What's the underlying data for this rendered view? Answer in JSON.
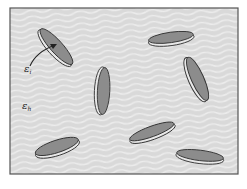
{
  "diagram": {
    "colors": {
      "host_fill": "#d9d9d9",
      "host_wave": "#ececec",
      "frame": "#555555",
      "disc_face": "#8c8c8c",
      "disc_rim": "#e8e8e8",
      "disc_outline": "#333333",
      "arrow": "#222222"
    },
    "labels": {
      "inclusion": {
        "symbol": "ε",
        "subscript": "i"
      },
      "host": {
        "symbol": "ε",
        "subscript": "h"
      }
    },
    "inclusions": [
      {
        "cx": 56,
        "cy": 47,
        "rx": 24,
        "ry": 7,
        "angle": 48
      },
      {
        "cx": 103,
        "cy": 91,
        "rx": 24,
        "ry": 7,
        "angle": 93
      },
      {
        "cx": 171,
        "cy": 38,
        "rx": 23,
        "ry": 6,
        "angle": -8
      },
      {
        "cx": 197,
        "cy": 79,
        "rx": 24,
        "ry": 7,
        "angle": 66
      },
      {
        "cx": 152,
        "cy": 132,
        "rx": 24,
        "ry": 6,
        "angle": -20
      },
      {
        "cx": 57,
        "cy": 147,
        "rx": 23,
        "ry": 7,
        "angle": -18
      },
      {
        "cx": 200,
        "cy": 156,
        "rx": 24,
        "ry": 6,
        "angle": 7
      }
    ]
  }
}
